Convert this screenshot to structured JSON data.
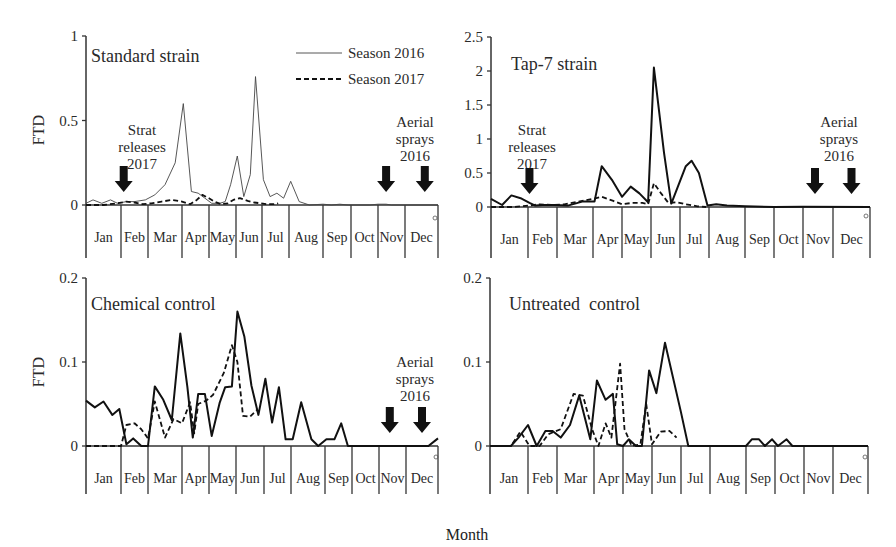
{
  "figure": {
    "x_axis_label": "Month",
    "y_axis_label": "FTD",
    "months": [
      "Jan",
      "Feb",
      "Mar",
      "Apr",
      "May",
      "Jun",
      "Jul",
      "Aug",
      "Sep",
      "Oct",
      "Nov",
      "Dec"
    ],
    "legend": [
      {
        "label": "Season 2016",
        "style": "solid-thin"
      },
      {
        "label": "Season 2017",
        "style": "dashed"
      }
    ],
    "annotations": {
      "strat": [
        "Strat",
        "releases",
        "2017"
      ],
      "aerial": [
        "Aerial",
        "sprays",
        "2016"
      ]
    }
  },
  "chart_data": [
    {
      "type": "line",
      "title": "Standard strain",
      "xlabel": "Month",
      "ylabel": "FTD",
      "ylim": [
        0,
        1
      ],
      "yticks": [
        "0",
        "0.5",
        "1"
      ],
      "ytick_values": [
        0,
        0.5,
        1
      ],
      "categories": [
        "Jan",
        "Feb",
        "Mar",
        "Apr",
        "May",
        "Jun",
        "Jul",
        "Aug",
        "Sep",
        "Oct",
        "Nov",
        "Dec"
      ],
      "legend_position": "upper-right",
      "arrows": {
        "strat_releases_2017": [
          1.1
        ],
        "aerial_sprays_2016": [
          10.3,
          11.6
        ]
      },
      "series": [
        {
          "name": "Season 2016",
          "style": "thin",
          "points": [
            [
              0,
              0.01
            ],
            [
              0.2,
              0.03
            ],
            [
              0.45,
              0.01
            ],
            [
              0.7,
              0.03
            ],
            [
              0.9,
              0.01
            ],
            [
              1.2,
              0.02
            ],
            [
              1.5,
              0.02
            ],
            [
              1.9,
              0.03
            ],
            [
              2.2,
              0.06
            ],
            [
              2.5,
              0.12
            ],
            [
              2.8,
              0.25
            ],
            [
              3.05,
              0.6
            ],
            [
              3.35,
              0.08
            ],
            [
              3.6,
              0.07
            ],
            [
              3.85,
              0.04
            ],
            [
              4.1,
              0.01
            ],
            [
              4.4,
              0.01
            ],
            [
              4.6,
              0.02
            ],
            [
              4.8,
              0.12
            ],
            [
              5.05,
              0.29
            ],
            [
              5.3,
              0.05
            ],
            [
              5.55,
              0.18
            ],
            [
              5.75,
              0.76
            ],
            [
              6.05,
              0.15
            ],
            [
              6.3,
              0.05
            ],
            [
              6.55,
              0.07
            ],
            [
              6.8,
              0.04
            ],
            [
              7.05,
              0.14
            ],
            [
              7.3,
              0.02
            ],
            [
              7.6,
              0
            ],
            [
              8.0,
              0.005
            ],
            [
              8.3,
              0
            ],
            [
              8.6,
              0.005
            ],
            [
              8.9,
              0
            ],
            [
              9.7,
              0
            ],
            [
              10.0,
              0.005
            ],
            [
              10.3,
              0.005
            ],
            [
              10.5,
              0
            ],
            [
              12,
              0
            ]
          ]
        },
        {
          "name": "Season 2017",
          "style": "dashed",
          "points": [
            [
              0,
              0
            ],
            [
              0.5,
              0
            ],
            [
              0.9,
              0.01
            ],
            [
              1.2,
              0.02
            ],
            [
              1.5,
              0.015
            ],
            [
              1.8,
              0.005
            ],
            [
              2.1,
              0.01
            ],
            [
              2.4,
              0.02
            ],
            [
              2.7,
              0.03
            ],
            [
              3.0,
              0.02
            ],
            [
              3.3,
              0.005
            ],
            [
              3.55,
              0.03
            ],
            [
              3.75,
              0.06
            ],
            [
              4.0,
              0.04
            ],
            [
              4.2,
              0.02
            ],
            [
              4.45,
              0.005
            ],
            [
              4.7,
              0.01
            ],
            [
              4.9,
              0.03
            ],
            [
              5.15,
              0.04
            ],
            [
              5.45,
              0.025
            ],
            [
              5.7,
              0.015
            ],
            [
              5.95,
              0.01
            ],
            [
              6.2,
              0.005
            ],
            [
              6.45,
              0.005
            ],
            [
              6.6,
              0.01
            ]
          ]
        }
      ]
    },
    {
      "type": "line",
      "title": "Tap-7 strain",
      "xlabel": "Month",
      "ylabel": "",
      "ylim": [
        0,
        2.5
      ],
      "yticks": [
        "0",
        "0.5",
        "1",
        "1.5",
        "2",
        "2.5"
      ],
      "ytick_values": [
        0,
        0.5,
        1,
        1.5,
        2,
        2.5
      ],
      "categories": [
        "Jan",
        "Feb",
        "Mar",
        "Apr",
        "May",
        "Jun",
        "Jul",
        "Aug",
        "Sep",
        "Oct",
        "Nov",
        "Dec"
      ],
      "arrows": {
        "strat_releases_2017": [
          1.05
        ],
        "aerial_sprays_2016": [
          10.4,
          11.5
        ]
      },
      "series": [
        {
          "name": "Season 2016",
          "style": "bold",
          "points": [
            [
              0,
              0.12
            ],
            [
              0.3,
              0.03
            ],
            [
              0.55,
              0.17
            ],
            [
              0.8,
              0.13
            ],
            [
              1.05,
              0.06
            ],
            [
              1.25,
              0.02
            ],
            [
              1.5,
              0.03
            ],
            [
              1.9,
              0.03
            ],
            [
              2.3,
              0.02
            ],
            [
              2.7,
              0.08
            ],
            [
              3.05,
              0.08
            ],
            [
              3.3,
              0.6
            ],
            [
              3.65,
              0.4
            ],
            [
              4.0,
              0.15
            ],
            [
              4.3,
              0.3
            ],
            [
              4.6,
              0.2
            ],
            [
              4.9,
              0.07
            ],
            [
              5.1,
              2.05
            ],
            [
              5.45,
              0.8
            ],
            [
              5.7,
              0.05
            ],
            [
              6.2,
              0.6
            ],
            [
              6.4,
              0.68
            ],
            [
              6.65,
              0.5
            ],
            [
              6.95,
              0.02
            ],
            [
              7.2,
              0.04
            ],
            [
              7.5,
              0.02
            ],
            [
              8.0,
              0.01
            ],
            [
              9.0,
              0
            ],
            [
              10.0,
              0.005
            ],
            [
              12,
              0
            ]
          ]
        },
        {
          "name": "Season 2017",
          "style": "dashed",
          "points": [
            [
              0,
              0
            ],
            [
              0.6,
              0
            ],
            [
              1.0,
              0.02
            ],
            [
              1.4,
              0.04
            ],
            [
              1.8,
              0.03
            ],
            [
              2.2,
              0.04
            ],
            [
              2.6,
              0.08
            ],
            [
              3.0,
              0.12
            ],
            [
              3.3,
              0.15
            ],
            [
              3.7,
              0.09
            ],
            [
              4.0,
              0.04
            ],
            [
              4.35,
              0.06
            ],
            [
              4.7,
              0.06
            ],
            [
              4.9,
              0.04
            ],
            [
              5.1,
              0.35
            ],
            [
              5.35,
              0.2
            ],
            [
              5.6,
              0.06
            ],
            [
              5.9,
              0.07
            ],
            [
              6.2,
              0.04
            ],
            [
              6.6,
              0.01
            ],
            [
              6.9,
              0
            ]
          ]
        }
      ]
    },
    {
      "type": "line",
      "title": "Chemical control",
      "xlabel": "Month",
      "ylabel": "FTD",
      "ylim": [
        0,
        0.2
      ],
      "yticks": [
        "0",
        "0.1",
        "0.2"
      ],
      "ytick_values": [
        0,
        0.1,
        0.2
      ],
      "categories": [
        "Jan",
        "Feb",
        "Mar",
        "Apr",
        "May",
        "Jun",
        "Jul",
        "Aug",
        "Sep",
        "Oct",
        "Nov",
        "Dec"
      ],
      "arrows": {
        "aerial_sprays_2016": [
          10.4,
          11.5
        ]
      },
      "series": [
        {
          "name": "Season 2016",
          "style": "bold",
          "points": [
            [
              0,
              0.054
            ],
            [
              0.25,
              0.046
            ],
            [
              0.5,
              0.053
            ],
            [
              0.75,
              0.037
            ],
            [
              0.95,
              0.044
            ],
            [
              1.2,
              0.002
            ],
            [
              1.45,
              0.009
            ],
            [
              1.75,
              0
            ],
            [
              2.0,
              0
            ],
            [
              2.2,
              0.071
            ],
            [
              2.45,
              0.055
            ],
            [
              2.7,
              0.031
            ],
            [
              2.95,
              0.134
            ],
            [
              3.2,
              0.07
            ],
            [
              3.4,
              0.01
            ],
            [
              3.6,
              0.062
            ],
            [
              3.85,
              0.062
            ],
            [
              4.1,
              0.012
            ],
            [
              4.4,
              0.052
            ],
            [
              4.6,
              0.07
            ],
            [
              4.85,
              0.071
            ],
            [
              5.05,
              0.16
            ],
            [
              5.3,
              0.13
            ],
            [
              5.55,
              0.072
            ],
            [
              5.8,
              0.037
            ],
            [
              6.05,
              0.08
            ],
            [
              6.3,
              0.028
            ],
            [
              6.55,
              0.07
            ],
            [
              6.8,
              0.008
            ],
            [
              7.05,
              0.008
            ],
            [
              7.3,
              0.052
            ],
            [
              7.6,
              0.008
            ],
            [
              7.8,
              0
            ],
            [
              8.05,
              0.008
            ],
            [
              8.35,
              0.008
            ],
            [
              8.6,
              0.027
            ],
            [
              8.85,
              0
            ],
            [
              11.7,
              0
            ],
            [
              12.0,
              0.009
            ]
          ]
        },
        {
          "name": "Season 2017",
          "style": "dashed",
          "points": [
            [
              0,
              0
            ],
            [
              1.0,
              0
            ],
            [
              1.2,
              0.025
            ],
            [
              1.5,
              0.027
            ],
            [
              1.75,
              0.02
            ],
            [
              2.0,
              0.009
            ],
            [
              2.2,
              0.053
            ],
            [
              2.5,
              0.01
            ],
            [
              2.75,
              0.032
            ],
            [
              3.0,
              0.027
            ],
            [
              3.3,
              0.052
            ],
            [
              3.45,
              0.015
            ],
            [
              3.6,
              0.05
            ],
            [
              3.9,
              0.054
            ],
            [
              4.15,
              0.061
            ],
            [
              4.55,
              0.087
            ],
            [
              4.85,
              0.12
            ],
            [
              5.05,
              0.1
            ],
            [
              5.25,
              0.036
            ],
            [
              5.5,
              0.035
            ],
            [
              5.75,
              0.043
            ]
          ]
        }
      ]
    },
    {
      "type": "line",
      "title": "Untreated  control",
      "xlabel": "Month",
      "ylabel": "",
      "ylim": [
        0,
        0.2
      ],
      "yticks": [
        "0",
        "0.1",
        "0.2"
      ],
      "ytick_values": [
        0,
        0.1,
        0.2
      ],
      "categories": [
        "Jan",
        "Feb",
        "Mar",
        "Apr",
        "May",
        "Jun",
        "Jul",
        "Aug",
        "Sep",
        "Oct",
        "Nov",
        "Dec"
      ],
      "arrows": {},
      "series": [
        {
          "name": "Season 2016",
          "style": "bold",
          "points": [
            [
              0,
              0
            ],
            [
              0.55,
              0
            ],
            [
              0.75,
              0.01
            ],
            [
              1.0,
              0.025
            ],
            [
              1.3,
              0
            ],
            [
              1.6,
              0.018
            ],
            [
              1.85,
              0.018
            ],
            [
              2.1,
              0.01
            ],
            [
              2.35,
              0.025
            ],
            [
              2.6,
              0.06
            ],
            [
              2.9,
              0.008
            ],
            [
              3.1,
              0.078
            ],
            [
              3.4,
              0.055
            ],
            [
              3.65,
              0.062
            ],
            [
              3.8,
              0.002
            ],
            [
              4.0,
              0
            ],
            [
              4.2,
              0.008
            ],
            [
              4.45,
              0
            ],
            [
              4.65,
              0
            ],
            [
              4.9,
              0.09
            ],
            [
              5.15,
              0.063
            ],
            [
              5.45,
              0.123
            ],
            [
              6.0,
              0.04
            ],
            [
              6.25,
              0
            ],
            [
              8.0,
              0
            ],
            [
              8.2,
              0.008
            ],
            [
              8.45,
              0.008
            ],
            [
              8.65,
              0
            ],
            [
              8.9,
              0.008
            ],
            [
              9.1,
              0
            ],
            [
              9.4,
              0.008
            ],
            [
              9.6,
              0
            ],
            [
              12,
              0
            ]
          ]
        },
        {
          "name": "Season 2017",
          "style": "dashed",
          "points": [
            [
              0,
              0
            ],
            [
              0.55,
              0
            ],
            [
              0.8,
              0.017
            ],
            [
              1.05,
              0
            ],
            [
              1.4,
              0
            ],
            [
              1.7,
              0.014
            ],
            [
              2.1,
              0.02
            ],
            [
              2.45,
              0.062
            ],
            [
              2.7,
              0.06
            ],
            [
              2.95,
              0.02
            ],
            [
              3.15,
              0
            ],
            [
              3.4,
              0.027
            ],
            [
              3.6,
              0.01
            ],
            [
              3.9,
              0.098
            ],
            [
              4.05,
              0.02
            ],
            [
              4.3,
              0
            ],
            [
              4.6,
              0.002
            ],
            [
              4.8,
              0.05
            ],
            [
              5.0,
              0.002
            ],
            [
              5.3,
              0.017
            ],
            [
              5.6,
              0.018
            ],
            [
              5.85,
              0.01
            ]
          ]
        }
      ]
    }
  ]
}
